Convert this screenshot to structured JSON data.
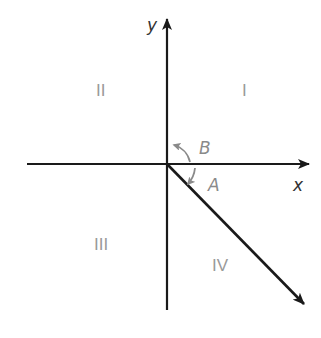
{
  "diagram": {
    "type": "cartesian-plane-angle",
    "axes": {
      "x_label": "x",
      "y_label": "y"
    },
    "quadrants": [
      {
        "id": "I",
        "label": "I"
      },
      {
        "id": "II",
        "label": "II"
      },
      {
        "id": "III",
        "label": "III"
      },
      {
        "id": "IV",
        "label": "IV"
      }
    ],
    "angles": [
      {
        "id": "A",
        "label": "A",
        "direction": "clockwise",
        "note": "from positive x-axis to ray in quadrant IV"
      },
      {
        "id": "B",
        "label": "B",
        "direction": "counterclockwise",
        "note": "from positive x-axis toward positive y-axis"
      }
    ],
    "ray": {
      "quadrant": "IV",
      "direction_deg": -45
    },
    "colors": {
      "axis": "#1a1a1a",
      "ray": "#1a1a1a",
      "angle_arc": "#8a8a8a",
      "quadrant_label": "#9a9a9a",
      "axis_label": "#333333"
    }
  }
}
